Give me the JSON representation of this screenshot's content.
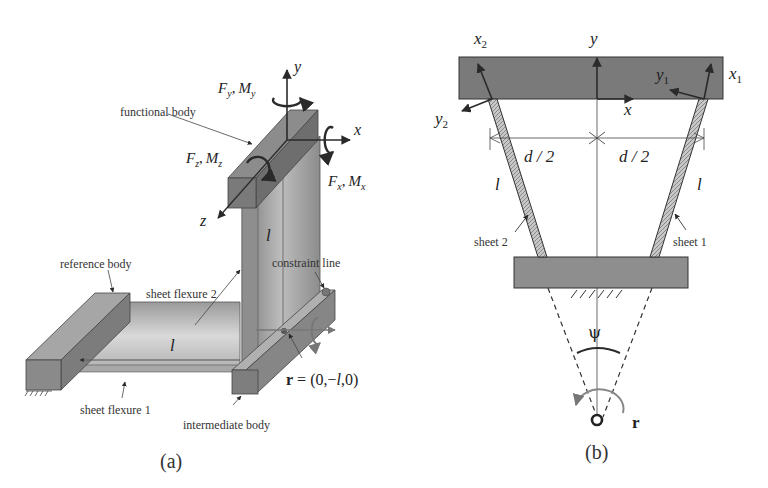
{
  "figure_a": {
    "caption": "(a)",
    "labels": {
      "functional_body": "functional body",
      "reference_body": "reference body",
      "sheet_flexure_2": "sheet flexure 2",
      "sheet_flexure_1": "sheet flexure 1",
      "constraint_line": "constraint line",
      "intermediate_body": "intermediate body"
    },
    "axes": {
      "x": "x",
      "y": "y",
      "z": "z"
    },
    "loads": {
      "y_F": "F",
      "y_F_sub": "y",
      "y_M": "M",
      "y_M_sub": "y",
      "x_F": "F",
      "x_F_sub": "x",
      "x_M": "M",
      "x_M_sub": "x",
      "z_F": "F",
      "z_F_sub": "z",
      "z_M": "M",
      "z_M_sub": "z",
      "sep": ","
    },
    "length_label": "l",
    "r_vector": {
      "bold": "r",
      "rest": " = (0,−",
      "l": "l",
      "end": ",0)"
    }
  },
  "figure_b": {
    "caption": "(b)",
    "axes": {
      "x": "x",
      "y": "y",
      "x1": "x",
      "x1_sub": "1",
      "y1": "y",
      "y1_sub": "1",
      "x2": "x",
      "x2_sub": "2",
      "y2": "y",
      "y2_sub": "2"
    },
    "half_width_left": "d / 2",
    "half_width_right": "d / 2",
    "length_left": "l",
    "length_right": "l",
    "sheet_2": "sheet 2",
    "sheet_1": "sheet 1",
    "angle": "ψ",
    "r_label": "r"
  },
  "colors": {
    "body_dark": "#6e6e6e",
    "body_mid": "#8a8a8a",
    "body_light": "#b4b4b4",
    "sheet_light": "#d8d8d8",
    "ink": "#2a2a2a"
  }
}
